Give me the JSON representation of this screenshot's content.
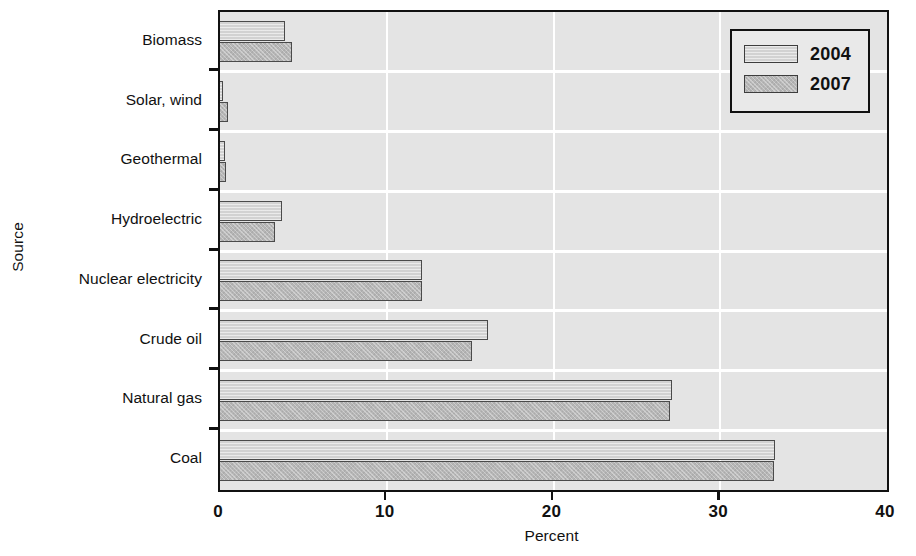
{
  "chart_data": {
    "type": "bar",
    "orientation": "horizontal",
    "title": "",
    "xlabel": "Percent",
    "ylabel": "Source",
    "categories": [
      "Biomass",
      "Solar, wind",
      "Geothermal",
      "Hydroelectric",
      "Nuclear electricity",
      "Crude oil",
      "Natural gas",
      "Coal"
    ],
    "series": [
      {
        "name": "2004",
        "values": [
          3.9,
          0.2,
          0.3,
          3.7,
          12.1,
          16.1,
          27.1,
          33.3
        ],
        "color": "#d2d2d2"
      },
      {
        "name": "2007",
        "values": [
          4.3,
          0.5,
          0.35,
          3.3,
          12.1,
          15.1,
          27.0,
          33.2
        ],
        "color": "#b6b6b6"
      }
    ],
    "xlim": [
      0,
      40
    ],
    "xticks": [
      0,
      10,
      20,
      30,
      40
    ],
    "xtick_labels": [
      "0",
      "10",
      "20",
      "30",
      "40"
    ],
    "grid": true,
    "grid_color": "#ffffff",
    "plot_background": "#e4e4e4",
    "legend_position": "top-right",
    "legend_entries": [
      "2004",
      "2007"
    ]
  },
  "axes": {
    "y_title": "Source",
    "x_title": "Percent"
  },
  "legend": {
    "items": [
      {
        "label": "2004"
      },
      {
        "label": "2007"
      }
    ]
  }
}
